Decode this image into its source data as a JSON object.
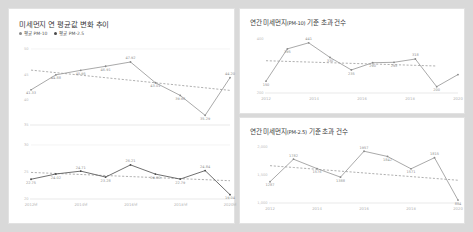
{
  "charts": {
    "avg": {
      "title": "미세먼지 연 평균값 변화 추이",
      "legend": [
        {
          "label": "평균 PM-10"
        },
        {
          "label": "평균 PM-2.5"
        }
      ]
    },
    "pm10_exceed": {
      "title_main": "연간 미세먼지",
      "title_unit": "(PM-10)",
      "title_tail": " 기준 초과 건수"
    },
    "pm25_exceed": {
      "title_main": "연간 미세먼지",
      "title_unit": "(PM-2.5)",
      "title_tail": " 기준 초과 건수"
    }
  },
  "chart_data": [
    {
      "type": "line",
      "title": "미세먼지 연 평균값 변화 추이",
      "name": "annual-average-pm10",
      "x": [
        "2012",
        "2013",
        "2014",
        "2015",
        "2016",
        "2017",
        "2018",
        "2019",
        "2020"
      ],
      "xtick_labels": [
        "2012년",
        "2014년",
        "2016년",
        "2018년",
        "2020년"
      ],
      "ytick_labels": [
        "50",
        "45",
        "40",
        "35"
      ],
      "ylim": [
        33,
        51
      ],
      "grid": true,
      "legend_position": "top-left",
      "series": [
        {
          "name": "평균 PM-10",
          "values": [
            41.33,
            44.88,
            45.95,
            46.91,
            47.92,
            43.01,
            40.0,
            35.29,
            44.2
          ],
          "labels": [
            "41.33",
            "44.88",
            "45.95",
            "46.91",
            "47.92",
            "43.01",
            "39.98",
            "35.29",
            "44.20"
          ]
        },
        {
          "name": "추세선 PM-10",
          "trend": true,
          "values": [
            46.0,
            45.4,
            44.8,
            44.2,
            43.6,
            43.0,
            42.4,
            41.8,
            41.2
          ]
        }
      ]
    },
    {
      "type": "line",
      "title": "미세먼지 연 평균값 변화 추이 (PM-2.5)",
      "name": "annual-average-pm25",
      "x": [
        "2012",
        "2013",
        "2014",
        "2015",
        "2016",
        "2017",
        "2018",
        "2019",
        "2020"
      ],
      "xtick_labels": [
        "2012년",
        "2014년",
        "2016년",
        "2018년",
        "2020년"
      ],
      "ytick_labels": [
        "30",
        "25",
        "20"
      ],
      "ylim": [
        18,
        31
      ],
      "grid": true,
      "series": [
        {
          "name": "평균 PM-2.5",
          "values": [
            22.75,
            24.02,
            24.71,
            23.28,
            26.21,
            24.0,
            22.79,
            24.84,
            19.04
          ],
          "labels": [
            "22.75",
            "24.02",
            "24.71",
            "23.28",
            "26.21",
            "24.00",
            "22.79",
            "24.84",
            "19.04"
          ]
        },
        {
          "name": "추세선 PM-2.5",
          "trend": true,
          "values": [
            24.4,
            24.15,
            23.9,
            23.65,
            23.4,
            23.15,
            22.9,
            22.65,
            22.4
          ]
        }
      ]
    },
    {
      "type": "line",
      "title": "연간 미세먼지(PM-10) 기준 초과 건수",
      "name": "pm10-exceedance-count",
      "x": [
        "2012",
        "2013",
        "2014",
        "2015",
        "2016",
        "2017",
        "2018",
        "2019",
        "2020"
      ],
      "xtick_labels": [
        "2012",
        "2014",
        "2016",
        "2018",
        "2020"
      ],
      "ytick_labels": [
        "400",
        "200"
      ],
      "ylim": [
        60,
        470
      ],
      "grid": false,
      "series": [
        {
          "name": "기준 초과 건수",
          "values": [
            150,
            395,
            441,
            330,
            235,
            290,
            293,
            318,
            108,
            200
          ],
          "labels": [
            "150",
            "395",
            "441",
            "330",
            "235",
            "290",
            "293",
            "318",
            "200"
          ]
        },
        {
          "name": "추세선",
          "trend": true,
          "values": [
            305,
            300,
            295,
            290,
            285,
            280,
            275,
            270,
            265
          ]
        }
      ]
    },
    {
      "type": "line",
      "title": "연간 미세먼지(PM-2.5) 기준 초과 건수",
      "name": "pm25-exceedance-count",
      "x": [
        "2012",
        "2013",
        "2014",
        "2015",
        "2016",
        "2017",
        "2018",
        "2019",
        "2020"
      ],
      "xtick_labels": [
        "2012",
        "2014",
        "2016",
        "2018",
        "2020"
      ],
      "ytick_labels": [
        "2,000",
        "1,500",
        "1,000"
      ],
      "ylim": [
        820,
        2050
      ],
      "grid": false,
      "series": [
        {
          "name": "기준 초과 건수",
          "values": [
            1287,
            1782,
            1576,
            1388,
            1957,
            1842,
            1571,
            1815,
            884
          ],
          "labels": [
            "1287",
            "1782",
            "1576",
            "1388",
            "1957",
            "1842",
            "1571",
            "1815",
            "884"
          ]
        },
        {
          "name": "추세선",
          "trend": true,
          "values": [
            1640,
            1600,
            1560,
            1520,
            1480,
            1440,
            1400,
            1360,
            1320
          ]
        }
      ]
    }
  ]
}
